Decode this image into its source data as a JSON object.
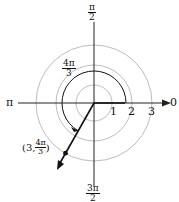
{
  "diagram": {
    "type": "polar-coordinate-plot",
    "axis_labels": {
      "right": "0",
      "top_num": "π",
      "top_den": "2",
      "left": "π",
      "bottom_num": "3π",
      "bottom_den": "2"
    },
    "radius_ticks": [
      "1",
      "2",
      "3"
    ],
    "angle_label": {
      "num": "4π",
      "den": "3"
    },
    "point_label": {
      "prefix": "(3, ",
      "num": "4π",
      "den": "3",
      "suffix": ")"
    },
    "point": {
      "r": 3,
      "theta": "4π/3"
    },
    "colors": {
      "circle": "#bdbdbd",
      "axis": "#222222",
      "ray": "#111111"
    }
  }
}
